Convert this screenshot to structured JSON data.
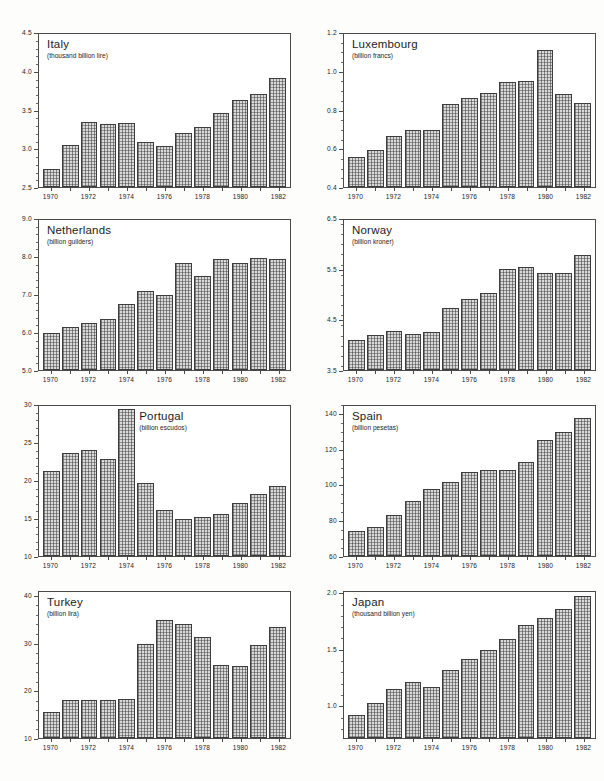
{
  "figure": {
    "kind": "small-multiples-bar-chart-sheet",
    "panel_count": 8,
    "shared_x_categories": [
      "1970",
      "1971",
      "1972",
      "1973",
      "1974",
      "1975",
      "1976",
      "1977",
      "1978",
      "1979",
      "1980",
      "1981",
      "1982"
    ],
    "labelled_x_ticks": [
      "1970",
      "1972",
      "1974",
      "1976",
      "1978",
      "1980",
      "1982"
    ],
    "ink_color": "#3d3d3d",
    "bar_fill": "#d9d9d9"
  },
  "chart_data": [
    {
      "type": "bar",
      "title": "Italy",
      "subtitle": "(thousand billion lire)",
      "xlabel": "",
      "ylabel": "thousand billion lire",
      "categories": [
        "1970",
        "1971",
        "1972",
        "1973",
        "1974",
        "1975",
        "1976",
        "1977",
        "1978",
        "1979",
        "1980",
        "1981",
        "1982"
      ],
      "values": [
        2.74,
        3.05,
        3.35,
        3.32,
        3.34,
        3.09,
        3.04,
        3.21,
        3.29,
        3.47,
        3.64,
        3.72,
        3.92
      ],
      "ylim": [
        2.5,
        4.5
      ],
      "yticks": [
        2.5,
        3.0,
        3.5,
        4.0,
        4.5
      ],
      "ytick_labels": [
        "2.5",
        "3.0",
        "3.5",
        "4.0",
        "4.5"
      ],
      "minor_tick_step": 0.1,
      "grid": false,
      "legend": "none",
      "title_align": "left"
    },
    {
      "type": "bar",
      "title": "Luxembourg",
      "subtitle": "(billion francs)",
      "xlabel": "",
      "ylabel": "billion francs",
      "categories": [
        "1970",
        "1971",
        "1972",
        "1973",
        "1974",
        "1975",
        "1976",
        "1977",
        "1978",
        "1979",
        "1980",
        "1981",
        "1982"
      ],
      "values": [
        0.555,
        0.595,
        0.665,
        0.7,
        0.7,
        0.835,
        0.865,
        0.89,
        0.95,
        0.955,
        1.115,
        0.885,
        0.84
      ],
      "ylim": [
        0.4,
        1.2
      ],
      "yticks": [
        0.4,
        0.6,
        0.8,
        1.0,
        1.2
      ],
      "ytick_labels": [
        "0.4",
        "0.6",
        "0.8",
        "1.0",
        "1.2"
      ],
      "minor_tick_step": 0.05,
      "grid": false,
      "legend": "none",
      "title_align": "left"
    },
    {
      "type": "bar",
      "title": "Netherlands",
      "subtitle": "(billion guilders)",
      "xlabel": "",
      "ylabel": "billion guilders",
      "categories": [
        "1970",
        "1971",
        "1972",
        "1973",
        "1974",
        "1975",
        "1976",
        "1977",
        "1978",
        "1979",
        "1980",
        "1981",
        "1982"
      ],
      "values": [
        6.0,
        6.15,
        6.25,
        6.35,
        6.75,
        7.1,
        7.0,
        7.85,
        7.5,
        7.95,
        7.85,
        8.0,
        7.95
      ],
      "ylim": [
        5.0,
        9.0
      ],
      "yticks": [
        5.0,
        6.0,
        7.0,
        8.0,
        9.0
      ],
      "ytick_labels": [
        "5.0",
        "6.0",
        "7.0",
        "8.0",
        "9.0"
      ],
      "minor_tick_step": 0.2,
      "grid": false,
      "legend": "none",
      "title_align": "left"
    },
    {
      "type": "bar",
      "title": "Norway",
      "subtitle": "(billion kroner)",
      "xlabel": "",
      "ylabel": "billion kroner",
      "categories": [
        "1970",
        "1971",
        "1972",
        "1973",
        "1974",
        "1975",
        "1976",
        "1977",
        "1978",
        "1979",
        "1980",
        "1981",
        "1982"
      ],
      "values": [
        4.1,
        4.2,
        4.28,
        4.23,
        4.27,
        4.75,
        4.93,
        5.05,
        5.52,
        5.56,
        5.45,
        5.45,
        5.8
      ],
      "ylim": [
        3.5,
        6.5
      ],
      "yticks": [
        3.5,
        4.5,
        5.5,
        6.5
      ],
      "ytick_labels": [
        "3.5",
        "4.5",
        "5.5",
        "6.5"
      ],
      "minor_tick_step": 0.2,
      "grid": false,
      "legend": "none",
      "title_align": "left"
    },
    {
      "type": "bar",
      "title": "Portugal",
      "subtitle": "(billion escudos)",
      "xlabel": "",
      "ylabel": "billion escudos",
      "categories": [
        "1970",
        "1971",
        "1972",
        "1973",
        "1974",
        "1975",
        "1976",
        "1977",
        "1978",
        "1979",
        "1980",
        "1981",
        "1982"
      ],
      "values": [
        21.4,
        23.8,
        24.1,
        23.0,
        29.6,
        19.7,
        16.1,
        14.9,
        15.2,
        15.6,
        17.1,
        18.3,
        19.3
      ],
      "ylim": [
        10,
        30
      ],
      "yticks": [
        10,
        15,
        20,
        25,
        30
      ],
      "ytick_labels": [
        "10",
        "15",
        "20",
        "25",
        "30"
      ],
      "minor_tick_step": 1,
      "grid": false,
      "legend": "none",
      "title_align": "center"
    },
    {
      "type": "bar",
      "title": "Spain",
      "subtitle": "(billion pesetas)",
      "xlabel": "",
      "ylabel": "billion pesetas",
      "categories": [
        "1970",
        "1971",
        "1972",
        "1973",
        "1974",
        "1975",
        "1976",
        "1977",
        "1978",
        "1979",
        "1980",
        "1981",
        "1982"
      ],
      "values": [
        74.0,
        76.5,
        83.5,
        91.0,
        98.0,
        102.0,
        107.5,
        109.0,
        108.5,
        113.5,
        126.0,
        130.0,
        138.0
      ],
      "ylim": [
        60,
        145
      ],
      "yticks": [
        60,
        80,
        100,
        120,
        140
      ],
      "ytick_labels": [
        "60",
        "80",
        "100",
        "120",
        "140"
      ],
      "minor_tick_step": 5,
      "grid": false,
      "legend": "none",
      "title_align": "left"
    },
    {
      "type": "bar",
      "title": "Turkey",
      "subtitle": "(billion lira)",
      "xlabel": "",
      "ylabel": "billion lira",
      "categories": [
        "1970",
        "1971",
        "1972",
        "1973",
        "1974",
        "1975",
        "1976",
        "1977",
        "1978",
        "1979",
        "1980",
        "1981",
        "1982"
      ],
      "values": [
        15.5,
        18.0,
        18.1,
        18.1,
        18.2,
        30.0,
        35.0,
        34.3,
        31.4,
        25.5,
        25.2,
        29.8,
        33.5
      ],
      "ylim": [
        10,
        41
      ],
      "yticks": [
        10,
        20,
        30,
        40
      ],
      "ytick_labels": [
        "10",
        "20",
        "30",
        "40"
      ],
      "minor_tick_step": 2,
      "grid": false,
      "legend": "none",
      "title_align": "left"
    },
    {
      "type": "bar",
      "title": "Japan",
      "subtitle": "(thousand billion yen)",
      "xlabel": "",
      "ylabel": "thousand billion yen",
      "categories": [
        "1970",
        "1971",
        "1972",
        "1973",
        "1974",
        "1975",
        "1976",
        "1977",
        "1978",
        "1979",
        "1980",
        "1981",
        "1982"
      ],
      "values": [
        0.92,
        1.02,
        1.15,
        1.21,
        1.17,
        1.32,
        1.42,
        1.5,
        1.6,
        1.72,
        1.79,
        1.87,
        1.98
      ],
      "ylim": [
        0.71,
        2.02
      ],
      "yticks": [
        1.0,
        1.5,
        2.0
      ],
      "ytick_labels": [
        "1.0",
        "1.5",
        "2.0"
      ],
      "minor_tick_step": 0.1,
      "grid": false,
      "legend": "none",
      "title_align": "left"
    }
  ]
}
